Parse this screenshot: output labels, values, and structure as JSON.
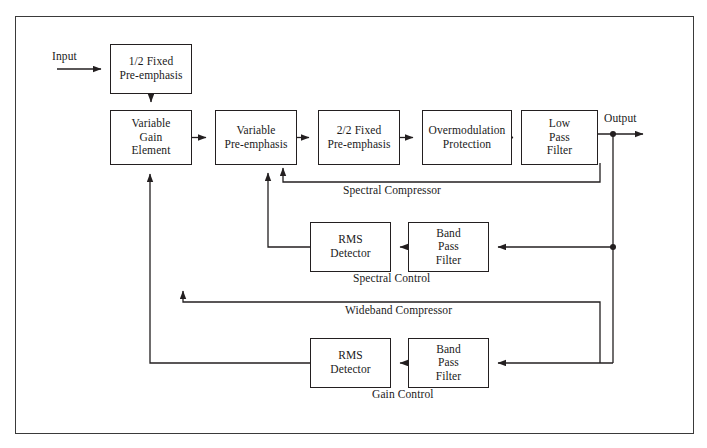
{
  "diagram": {
    "line_color": "#231f20",
    "box_border_color": "#231f20",
    "background": "#ffffff",
    "frame": {
      "x": 15,
      "y": 16,
      "width": 679,
      "height": 418
    },
    "io": {
      "input_label": "Input",
      "output_label": "Output"
    },
    "blocks": [
      {
        "id": "fixed-preemphasis-1",
        "label": "1/2 Fixed\nPre-emphasis",
        "x": 110,
        "y": 44,
        "width": 82,
        "height": 50
      },
      {
        "id": "variable-gain-element",
        "label": "Variable\nGain\nElement",
        "x": 110,
        "y": 110,
        "width": 82,
        "height": 55
      },
      {
        "id": "variable-preemphasis",
        "label": "Variable\nPre-emphasis",
        "x": 215,
        "y": 110,
        "width": 82,
        "height": 55
      },
      {
        "id": "fixed-preemphasis-2",
        "label": "2/2 Fixed\nPre-emphasis",
        "x": 318,
        "y": 110,
        "width": 82,
        "height": 55
      },
      {
        "id": "overmodulation",
        "label": "Overmodulation\nProtection",
        "x": 422,
        "y": 110,
        "width": 90,
        "height": 55
      },
      {
        "id": "low-pass-filter",
        "label": "Low\nPass\nFilter",
        "x": 521,
        "y": 110,
        "width": 77,
        "height": 55
      },
      {
        "id": "rms-detector-spectral",
        "label": "RMS\nDetector",
        "x": 310,
        "y": 222,
        "width": 81,
        "height": 50
      },
      {
        "id": "band-pass-spectral",
        "label": "Band\nPass\nFilter",
        "x": 408,
        "y": 222,
        "width": 81,
        "height": 50
      },
      {
        "id": "rms-detector-gain",
        "label": "RMS\nDetector",
        "x": 310,
        "y": 338,
        "width": 81,
        "height": 50
      },
      {
        "id": "band-pass-gain",
        "label": "Band\nPass\nFilter",
        "x": 408,
        "y": 338,
        "width": 81,
        "height": 50
      }
    ],
    "path_labels": [
      {
        "id": "spectral-compressor",
        "label": "Spectral Compressor",
        "x": 343,
        "y": 190
      },
      {
        "id": "spectral-control",
        "label": "Spectral Control",
        "x": 353,
        "y": 278
      },
      {
        "id": "wideband-compressor",
        "label": "Wideband Compressor",
        "x": 345,
        "y": 310
      },
      {
        "id": "gain-control",
        "label": "Gain Control",
        "x": 372,
        "y": 394
      }
    ]
  }
}
